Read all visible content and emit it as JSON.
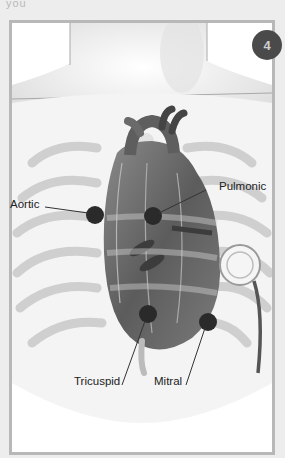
{
  "page": {
    "top_text_fragment": "you"
  },
  "figure": {
    "step_number": "4",
    "labels": {
      "aortic": "Aortic",
      "pulmonic": "Pulmonic",
      "tricuspid": "Tricuspid",
      "mitral": "Mitral"
    },
    "colors": {
      "frame_border": "#b8b8b8",
      "badge_bg": "#4a4a4a",
      "badge_text": "#cfcfcf",
      "marker": "#2a2a2a",
      "leader_line": "#333333",
      "page_bg": "#ededed"
    }
  }
}
